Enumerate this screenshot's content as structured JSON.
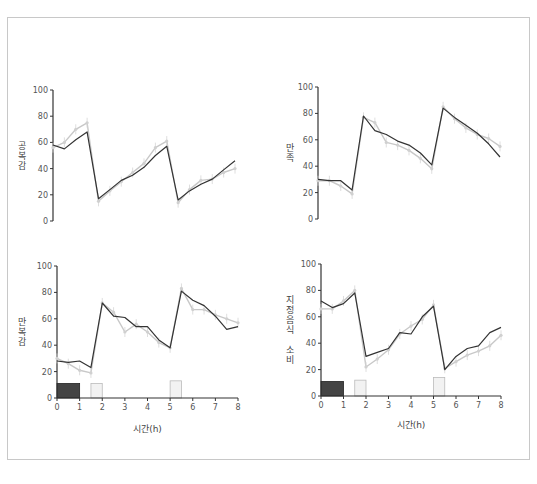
{
  "figure": {
    "border_color": "#c8c8c8",
    "series_colors": {
      "dark": "#333333",
      "light": "#c8c8c8"
    },
    "meal_bar_colors": {
      "dark": "#444444",
      "light": "#f2f2f2",
      "light_border": "#bbbbbb"
    }
  },
  "chart_data": [
    {
      "type": "line",
      "panel": "top-left",
      "title": "",
      "ylabel": "공복감",
      "xlabel": "",
      "ylim": [
        0,
        100
      ],
      "yticks": [
        0,
        20,
        40,
        60,
        80,
        100
      ],
      "xlim": [
        0,
        8
      ],
      "x": [
        0,
        0.5,
        1,
        1.5,
        2,
        2.5,
        3,
        3.5,
        4,
        4.5,
        5,
        5.5,
        6,
        6.5,
        7,
        7.5,
        8
      ],
      "series": [
        {
          "name": "dark",
          "values": [
            58,
            55,
            62,
            68,
            17,
            24,
            31,
            35,
            41,
            50,
            57,
            16,
            23,
            28,
            32,
            39,
            46
          ]
        },
        {
          "name": "light",
          "values": [
            56,
            60,
            70,
            75,
            15,
            23,
            30,
            37,
            44,
            56,
            61,
            14,
            24,
            31,
            32,
            37,
            40
          ]
        }
      ],
      "show_xticks": false,
      "meal_bars": []
    },
    {
      "type": "line",
      "panel": "top-right",
      "title": "",
      "ylabel": "만족",
      "xlabel": "",
      "ylim": [
        0,
        100
      ],
      "yticks": [
        0,
        20,
        40,
        60,
        80,
        100
      ],
      "xlim": [
        0,
        8
      ],
      "x": [
        0,
        0.5,
        1,
        1.5,
        2,
        2.5,
        3,
        3.5,
        4,
        4.5,
        5,
        5.5,
        6,
        6.5,
        7,
        7.5,
        8
      ],
      "series": [
        {
          "name": "dark",
          "values": [
            30,
            29,
            29,
            22,
            78,
            67,
            64,
            59,
            56,
            50,
            41,
            84,
            77,
            71,
            65,
            57,
            47
          ]
        },
        {
          "name": "light",
          "values": [
            29,
            29,
            25,
            19,
            77,
            73,
            58,
            56,
            52,
            46,
            38,
            85,
            76,
            69,
            64,
            61,
            55
          ]
        }
      ],
      "show_xticks": false,
      "meal_bars": []
    },
    {
      "type": "line",
      "panel": "bottom-left",
      "title": "",
      "ylabel": "만복감",
      "xlabel": "시간(h)",
      "ylim": [
        0,
        100
      ],
      "yticks": [
        0,
        20,
        40,
        60,
        80,
        100
      ],
      "xlim": [
        0,
        8
      ],
      "xticks": [
        0,
        1,
        2,
        3,
        4,
        5,
        6,
        7,
        8
      ],
      "x": [
        0,
        0.5,
        1,
        1.5,
        2,
        2.5,
        3,
        3.5,
        4,
        4.5,
        5,
        5.5,
        6,
        6.5,
        7,
        7.5,
        8
      ],
      "series": [
        {
          "name": "dark",
          "values": [
            28,
            27,
            28,
            23,
            72,
            62,
            61,
            54,
            54,
            44,
            38,
            81,
            74,
            70,
            62,
            52,
            54
          ]
        },
        {
          "name": "light",
          "values": [
            30,
            26,
            21,
            19,
            72,
            65,
            50,
            56,
            50,
            42,
            38,
            83,
            67,
            67,
            63,
            60,
            57
          ]
        }
      ],
      "show_xticks": true,
      "meal_bars": [
        {
          "x0": 0,
          "x1": 1,
          "height": 11,
          "style": "dark"
        },
        {
          "x0": 1.5,
          "x1": 2,
          "height": 11,
          "style": "light"
        },
        {
          "x0": 5,
          "x1": 5.5,
          "height": 13,
          "style": "light"
        }
      ]
    },
    {
      "type": "line",
      "panel": "bottom-right",
      "title": "",
      "ylabel": "지정음식 소비",
      "xlabel": "시간(h)",
      "ylim": [
        0,
        100
      ],
      "yticks": [
        0,
        20,
        40,
        60,
        80,
        100
      ],
      "xlim": [
        0,
        8
      ],
      "xticks": [
        0,
        1,
        2,
        3,
        4,
        5,
        6,
        7,
        8
      ],
      "x": [
        0,
        0.5,
        1,
        1.5,
        2,
        2.5,
        3,
        3.5,
        4,
        4.5,
        5,
        5.5,
        6,
        6.5,
        7,
        7.5,
        8
      ],
      "series": [
        {
          "name": "dark",
          "values": [
            72,
            67,
            70,
            78,
            30,
            33,
            36,
            48,
            47,
            60,
            68,
            20,
            30,
            36,
            38,
            48,
            52
          ]
        },
        {
          "name": "light",
          "values": [
            66,
            66,
            72,
            80,
            22,
            28,
            35,
            47,
            53,
            58,
            69,
            21,
            26,
            31,
            34,
            38,
            46
          ]
        }
      ],
      "show_xticks": true,
      "meal_bars": [
        {
          "x0": 0,
          "x1": 1,
          "height": 11,
          "style": "dark"
        },
        {
          "x0": 1.5,
          "x1": 2,
          "height": 12,
          "style": "light"
        },
        {
          "x0": 5,
          "x1": 5.5,
          "height": 14,
          "style": "light"
        }
      ]
    }
  ]
}
